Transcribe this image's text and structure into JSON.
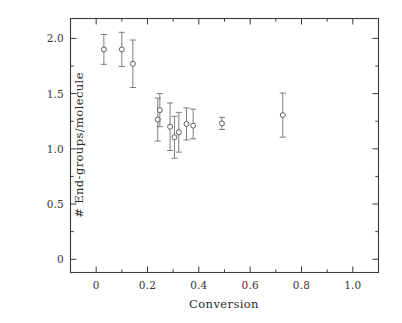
{
  "chart_data": {
    "type": "scatter",
    "title": "",
    "xlabel": "Conversion",
    "ylabel": "# End-groups/molecule",
    "xlim": [
      -0.1,
      1.1
    ],
    "ylim": [
      -0.12,
      2.18
    ],
    "grid": false,
    "legend": null,
    "marker": "open-circle",
    "errorbars": "vertical-symmetric",
    "xticks": [
      0,
      0.2,
      0.4,
      0.6,
      0.8,
      1.0
    ],
    "xticklabels": [
      "0",
      "0.2",
      "0.4",
      "0.6",
      "0.8",
      "1.0"
    ],
    "xminorticks": [
      -0.1,
      0.1,
      0.3,
      0.5,
      0.7,
      0.9,
      1.1
    ],
    "yticks": [
      0,
      0.5,
      1.0,
      1.5,
      2.0
    ],
    "yticklabels": [
      "0",
      "0.5",
      "1.0",
      "1.5",
      "2.0"
    ],
    "yminorticks": [
      0.25,
      0.75,
      1.25,
      1.75
    ],
    "series": [
      {
        "name": "End-groups per molecule",
        "points": [
          {
            "x": 0.03,
            "y": 1.9,
            "yerr_low": 0.135,
            "yerr_high": 0.135
          },
          {
            "x": 0.1,
            "y": 1.9,
            "yerr_low": 0.155,
            "yerr_high": 0.155
          },
          {
            "x": 0.143,
            "y": 1.77,
            "yerr_low": 0.215,
            "yerr_high": 0.215
          },
          {
            "x": 0.24,
            "y": 1.265,
            "yerr_low": 0.195,
            "yerr_high": 0.195
          },
          {
            "x": 0.248,
            "y": 1.35,
            "yerr_low": 0.15,
            "yerr_high": 0.15
          },
          {
            "x": 0.288,
            "y": 1.2,
            "yerr_low": 0.215,
            "yerr_high": 0.215
          },
          {
            "x": 0.305,
            "y": 1.105,
            "yerr_low": 0.19,
            "yerr_high": 0.19
          },
          {
            "x": 0.322,
            "y": 1.15,
            "yerr_low": 0.18,
            "yerr_high": 0.18
          },
          {
            "x": 0.352,
            "y": 1.225,
            "yerr_low": 0.145,
            "yerr_high": 0.145
          },
          {
            "x": 0.378,
            "y": 1.21,
            "yerr_low": 0.12,
            "yerr_high": 0.15
          },
          {
            "x": 0.49,
            "y": 1.23,
            "yerr_low": 0.055,
            "yerr_high": 0.055
          },
          {
            "x": 0.727,
            "y": 1.305,
            "yerr_low": 0.2,
            "yerr_high": 0.2
          }
        ]
      }
    ]
  },
  "colors": {
    "axis": "#3a3a3a",
    "marker": "#555555",
    "errorbar": "#777777",
    "background": "#ffffff",
    "text": "#2b2b2b"
  }
}
